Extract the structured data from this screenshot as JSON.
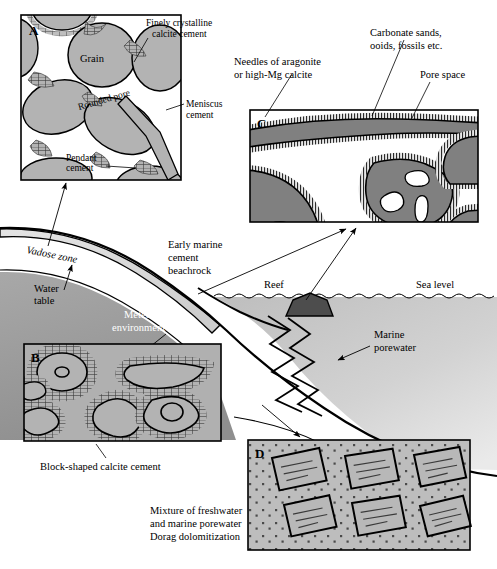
{
  "figure": {
    "type": "geological-cross-section-diagram",
    "title_hidden": "",
    "background_color": "#ffffff",
    "outline_color": "#000000"
  },
  "colors": {
    "grain_light_gray": "#b3b3b3",
    "grain_dark_gray": "#808080",
    "vadose_light": "#d9d9d9",
    "meteoric_gray": "#999999",
    "sea_gray": "#c6c6c6",
    "panel_bg_gray": "#b0b0b0",
    "panel_d_bg": "#bdbdbd",
    "reef_dark": "#4d4d4d",
    "white": "#ffffff"
  },
  "panels": [
    {
      "id": "A",
      "letter": "A",
      "caption_labels": [
        "Finely crystalline calcite cement",
        "Grain",
        "Rounded pore",
        "Meniscus cement",
        "Pendant cement"
      ],
      "describes": "vadose zone meteoric cement fabrics"
    },
    {
      "id": "B",
      "letter": "B",
      "caption_labels": [
        "Block-shaped calcite cement"
      ],
      "describes": "phreatic meteoric blocky calcite cement"
    },
    {
      "id": "C",
      "letter": "C",
      "caption_labels": [
        "Needles of aragonite or high-Mg calcite",
        "Carbonate sands, ooids, fossils etc.",
        "Pore space"
      ],
      "describes": "marine needle fringe cement"
    },
    {
      "id": "D",
      "letter": "D",
      "caption_labels": [
        "Mixture of freshwater and marine porewater Dorag dolomitization"
      ],
      "describes": "dolomite rhombs in mixing zone"
    }
  ],
  "labels": {
    "panel_a_letter": "A",
    "panel_b_letter": "B",
    "panel_c_letter": "C",
    "panel_d_letter": "D",
    "finely_crystalline_1": "Finely crystalline",
    "finely_crystalline_2": "calcite cement",
    "grain": "Grain",
    "rounded_pore": "Rounded pore",
    "meniscus_1": "Meniscus",
    "meniscus_2": "cement",
    "pendant_1": "Pendant",
    "pendant_2": "cement",
    "needles_1": "Needles of aragonite",
    "needles_2": "or high-Mg calcite",
    "carbonate_1": "Carbonate sands,",
    "carbonate_2": "ooids, fossils etc.",
    "pore_space": "Pore space",
    "vadose_zone": "Vadose zone",
    "water_table_1": "Water",
    "water_table_2": "table",
    "early_marine_1": "Early marine",
    "early_marine_2": "cement",
    "early_marine_3": "beachrock",
    "meteoric_1": "Meteoric",
    "meteoric_2": "environment",
    "reef": "Reef",
    "sea_level": "Sea level",
    "marine_porewater_1": "Marine",
    "marine_porewater_2": "porewater",
    "block_shaped": "Block-shaped calcite cement",
    "mixture_1": "Mixture of freshwater",
    "mixture_2": "and marine porewater",
    "mixture_3": "Dorag dolomitization"
  }
}
